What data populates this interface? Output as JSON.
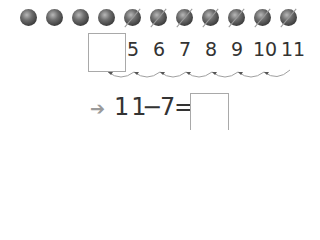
{
  "balls": {
    "total": 11,
    "crossed_out": 7,
    "plain": 4
  },
  "number_line": {
    "blank_box": "",
    "numbers": [
      "5",
      "6",
      "7",
      "8",
      "9",
      "10",
      "11"
    ],
    "hops": 7
  },
  "equation": {
    "arrow_icon": "➔",
    "left": "11",
    "operator": "−",
    "right": "7",
    "equals": "=",
    "answer": ""
  }
}
